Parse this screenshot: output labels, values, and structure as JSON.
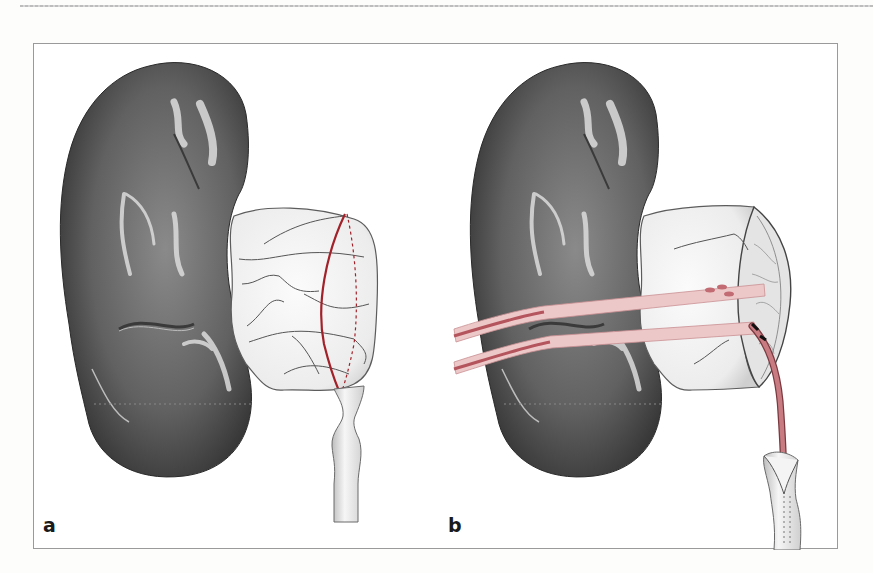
{
  "figure": {
    "panels": [
      {
        "id": "a",
        "label": "a",
        "description": "Kidney with dilated renal pelvis; curved red incision line with dashed back-side line across the pelvis above a narrowed ureteropelvic junction"
      },
      {
        "id": "b",
        "label": "b",
        "description": "Renal pelvis opened and reduced; two pink vessel loops/bands slung around the kidney; red stent/catheter passed through the opened pelvis into the spatulated ureter"
      }
    ],
    "colors": {
      "kidney": "#5a5a5a",
      "kidney_highlight": "#d9d9d9",
      "pelvis": "#f1f1f1",
      "incision": "#a3222a",
      "vessel_loop": "#edc8c8",
      "vessel_loop_dark": "#b4545c",
      "frame": "#9a9a9a"
    }
  }
}
